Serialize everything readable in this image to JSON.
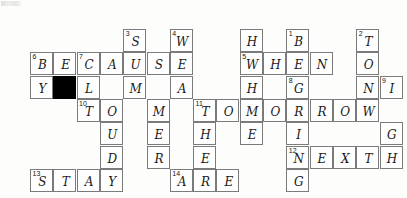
{
  "puzzle": {
    "title": "Crossword Puzzle Grid",
    "grid": {
      "origin_x": 30,
      "origin_y": 29,
      "cell_size": 23.3,
      "columns": 16,
      "rows": 7
    },
    "cells": [
      {
        "name": "cell-s-3",
        "col": 4,
        "row": 0,
        "letter": "S",
        "clue": "3",
        "blocked": false
      },
      {
        "name": "cell-w-4",
        "col": 6,
        "row": 0,
        "letter": "W",
        "clue": "4",
        "blocked": false
      },
      {
        "name": "cell-h-5d",
        "col": 9,
        "row": 0,
        "letter": "H",
        "clue": "",
        "blocked": false
      },
      {
        "name": "cell-b-1",
        "col": 11,
        "row": 0,
        "letter": "B",
        "clue": "1",
        "blocked": false
      },
      {
        "name": "cell-t-2",
        "col": 14,
        "row": 0,
        "letter": "T",
        "clue": "2",
        "blocked": false
      },
      {
        "name": "cell-w-5",
        "col": 9,
        "row": 1,
        "letter": "W",
        "clue": "5",
        "blocked": false
      },
      {
        "name": "cell-h-5b",
        "col": 10,
        "row": 1,
        "letter": "H",
        "clue": "",
        "blocked": false
      },
      {
        "name": "cell-e-5c",
        "col": 11,
        "row": 1,
        "letter": "E",
        "clue": "",
        "blocked": false
      },
      {
        "name": "cell-n-5d",
        "col": 12,
        "row": 1,
        "letter": "N",
        "clue": "",
        "blocked": false
      },
      {
        "name": "cell-o-2b",
        "col": 14,
        "row": 1,
        "letter": "O",
        "clue": "",
        "blocked": false
      },
      {
        "name": "cell-b-6",
        "col": 0,
        "row": 1,
        "letter": "B",
        "clue": "6",
        "blocked": false
      },
      {
        "name": "cell-e-6b",
        "col": 1,
        "row": 1,
        "letter": "E",
        "clue": "",
        "blocked": false
      },
      {
        "name": "cell-c-7",
        "col": 2,
        "row": 1,
        "letter": "C",
        "clue": "7",
        "blocked": false
      },
      {
        "name": "cell-a-6d",
        "col": 3,
        "row": 1,
        "letter": "A",
        "clue": "",
        "blocked": false
      },
      {
        "name": "cell-u-6e",
        "col": 4,
        "row": 1,
        "letter": "U",
        "clue": "",
        "blocked": false
      },
      {
        "name": "cell-s-6f",
        "col": 5,
        "row": 1,
        "letter": "S",
        "clue": "",
        "blocked": false
      },
      {
        "name": "cell-e-6g",
        "col": 6,
        "row": 1,
        "letter": "E",
        "clue": "",
        "blocked": false
      },
      {
        "name": "cell-y-6d2",
        "col": 0,
        "row": 2,
        "letter": "Y",
        "clue": "",
        "blocked": false
      },
      {
        "name": "cell-blocked",
        "col": 1,
        "row": 2,
        "letter": "",
        "clue": "",
        "blocked": true
      },
      {
        "name": "cell-l-7b",
        "col": 2,
        "row": 2,
        "letter": "L",
        "clue": "",
        "blocked": false
      },
      {
        "name": "cell-m-3b",
        "col": 4,
        "row": 2,
        "letter": "M",
        "clue": "",
        "blocked": false
      },
      {
        "name": "cell-a-4b",
        "col": 6,
        "row": 2,
        "letter": "A",
        "clue": "",
        "blocked": false
      },
      {
        "name": "cell-h-5e",
        "col": 9,
        "row": 2,
        "letter": "H",
        "clue": "",
        "blocked": false
      },
      {
        "name": "cell-g-8",
        "col": 11,
        "row": 2,
        "letter": "G",
        "clue": "8",
        "blocked": false
      },
      {
        "name": "cell-n-2c",
        "col": 14,
        "row": 2,
        "letter": "N",
        "clue": "",
        "blocked": false
      },
      {
        "name": "cell-i-9",
        "col": 15,
        "row": 2,
        "letter": "I",
        "clue": "9",
        "blocked": false
      },
      {
        "name": "cell-t-10",
        "col": 2,
        "row": 3,
        "letter": "T",
        "clue": "10",
        "blocked": false
      },
      {
        "name": "cell-o-7c",
        "col": 3,
        "row": 3,
        "letter": "O",
        "clue": "",
        "blocked": false
      },
      {
        "name": "cell-m-3c",
        "col": 5,
        "row": 3,
        "letter": "M",
        "clue": "",
        "blocked": false
      },
      {
        "name": "cell-t-11",
        "col": 7,
        "row": 3,
        "letter": "T",
        "clue": "11",
        "blocked": false
      },
      {
        "name": "cell-o-11b",
        "col": 8,
        "row": 3,
        "letter": "O",
        "clue": "",
        "blocked": false
      },
      {
        "name": "cell-m-11c",
        "col": 9,
        "row": 3,
        "letter": "M",
        "clue": "",
        "blocked": false
      },
      {
        "name": "cell-o-11d",
        "col": 10,
        "row": 3,
        "letter": "O",
        "clue": "",
        "blocked": false
      },
      {
        "name": "cell-r-11e",
        "col": 11,
        "row": 3,
        "letter": "R",
        "clue": "",
        "blocked": false
      },
      {
        "name": "cell-r-11f",
        "col": 12,
        "row": 3,
        "letter": "R",
        "clue": "",
        "blocked": false
      },
      {
        "name": "cell-o-11g",
        "col": 13,
        "row": 3,
        "letter": "O",
        "clue": "",
        "blocked": false
      },
      {
        "name": "cell-w-11h",
        "col": 14,
        "row": 3,
        "letter": "W",
        "clue": "",
        "blocked": false
      },
      {
        "name": "cell-u-7d",
        "col": 3,
        "row": 4,
        "letter": "U",
        "clue": "",
        "blocked": false
      },
      {
        "name": "cell-e-3d",
        "col": 5,
        "row": 4,
        "letter": "E",
        "clue": "",
        "blocked": false
      },
      {
        "name": "cell-h-4c",
        "col": 7,
        "row": 4,
        "letter": "H",
        "clue": "",
        "blocked": false
      },
      {
        "name": "cell-e-5f",
        "col": 9,
        "row": 4,
        "letter": "E",
        "clue": "",
        "blocked": false
      },
      {
        "name": "cell-i-8b",
        "col": 11,
        "row": 4,
        "letter": "I",
        "clue": "",
        "blocked": false
      },
      {
        "name": "cell-g-9b",
        "col": 15,
        "row": 4,
        "letter": "G",
        "clue": "",
        "blocked": false
      },
      {
        "name": "cell-d-7e",
        "col": 3,
        "row": 5,
        "letter": "D",
        "clue": "",
        "blocked": false
      },
      {
        "name": "cell-r-3e",
        "col": 5,
        "row": 5,
        "letter": "R",
        "clue": "",
        "blocked": false
      },
      {
        "name": "cell-e-4d",
        "col": 7,
        "row": 5,
        "letter": "E",
        "clue": "",
        "blocked": false
      },
      {
        "name": "cell-n-12",
        "col": 11,
        "row": 5,
        "letter": "N",
        "clue": "12",
        "blocked": false
      },
      {
        "name": "cell-e-12b",
        "col": 12,
        "row": 5,
        "letter": "E",
        "clue": "",
        "blocked": false
      },
      {
        "name": "cell-x-12c",
        "col": 13,
        "row": 5,
        "letter": "X",
        "clue": "",
        "blocked": false
      },
      {
        "name": "cell-t-12d",
        "col": 14,
        "row": 5,
        "letter": "T",
        "clue": "",
        "blocked": false
      },
      {
        "name": "cell-h-9c",
        "col": 15,
        "row": 5,
        "letter": "H",
        "clue": "",
        "blocked": false
      },
      {
        "name": "cell-s-13",
        "col": 0,
        "row": 6,
        "letter": "S",
        "clue": "13",
        "blocked": false
      },
      {
        "name": "cell-t-13b",
        "col": 1,
        "row": 6,
        "letter": "T",
        "clue": "",
        "blocked": false
      },
      {
        "name": "cell-a-13c",
        "col": 2,
        "row": 6,
        "letter": "A",
        "clue": "",
        "blocked": false
      },
      {
        "name": "cell-y-13d",
        "col": 3,
        "row": 6,
        "letter": "Y",
        "clue": "",
        "blocked": false
      },
      {
        "name": "cell-a-14",
        "col": 6,
        "row": 6,
        "letter": "A",
        "clue": "14",
        "blocked": false
      },
      {
        "name": "cell-r-14b",
        "col": 7,
        "row": 6,
        "letter": "R",
        "clue": "",
        "blocked": false
      },
      {
        "name": "cell-e-14c",
        "col": 8,
        "row": 6,
        "letter": "E",
        "clue": "",
        "blocked": false
      },
      {
        "name": "cell-g-8e",
        "col": 11,
        "row": 6,
        "letter": "G",
        "clue": "",
        "blocked": false
      }
    ],
    "answers": {
      "across": [
        {
          "number": "5",
          "word": "WHEN"
        },
        {
          "number": "6",
          "word": "BECAUSE"
        },
        {
          "number": "11",
          "word": "TOMORROW"
        },
        {
          "number": "12",
          "word": "NEXT"
        },
        {
          "number": "13",
          "word": "STAY"
        },
        {
          "number": "14",
          "word": "ARE"
        },
        {
          "number": "9",
          "word": "IT"
        }
      ],
      "down": [
        {
          "number": "1",
          "word": "BEING"
        },
        {
          "number": "2",
          "word": "TONIGHT"
        },
        {
          "number": "3",
          "word": "SUMMER"
        },
        {
          "number": "4",
          "word": "WEATHER"
        },
        {
          "number": "5",
          "word": "WHERE"
        },
        {
          "number": "6",
          "word": "BY"
        },
        {
          "number": "7",
          "word": "CLOUDY"
        },
        {
          "number": "8",
          "word": "GOING"
        },
        {
          "number": "9",
          "word": "IGHT"
        },
        {
          "number": "10",
          "word": "TO"
        }
      ]
    },
    "colors": {
      "background": "#fdfdfb",
      "cell_fill": "#ffffff",
      "cell_border": "#7b7b7b",
      "blocked_fill": "#000000",
      "letter_color": "#1a1a1a",
      "clue_number_color": "#141414"
    }
  }
}
